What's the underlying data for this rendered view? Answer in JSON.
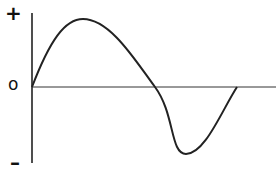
{
  "diagram": {
    "type": "sine-wave",
    "labels": {
      "positive": "+",
      "zero": "o",
      "negative": "–"
    },
    "colors": {
      "stroke": "#222222",
      "background": "#ffffff"
    },
    "curve": {
      "description": "one full cycle of a sine wave starting at zero, peaking positive, crossing zero, dipping negative, returning to zero",
      "cycles": 1
    }
  }
}
